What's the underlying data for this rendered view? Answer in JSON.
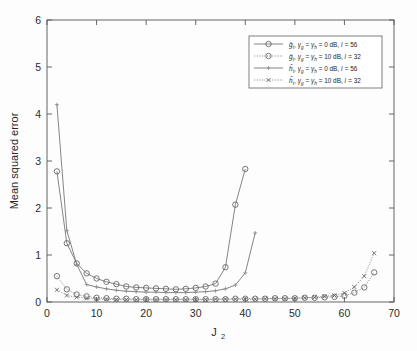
{
  "chart_data": {
    "type": "line",
    "title": "",
    "xlabel": "J_2",
    "xlabel_base": "J",
    "xlabel_sub": "2",
    "ylabel": "Mean squared error",
    "xlim": [
      0,
      70
    ],
    "ylim": [
      0,
      6
    ],
    "xticks": [
      0,
      10,
      20,
      30,
      40,
      50,
      60,
      70
    ],
    "yticks": [
      0,
      1,
      2,
      3,
      4,
      5,
      6
    ],
    "grid": false,
    "legend_position": "upper right",
    "series": [
      {
        "name": "g_hat_t, gamma_g = gamma_h = 0 dB, l = 56",
        "legend_label_parts": {
          "symbol": "g",
          "symbol_sub": "t",
          "gamma1_sub": "g",
          "gamma2_sub": "h",
          "snr": "0 dB",
          "l_value": "56"
        },
        "marker": "circle",
        "linestyle": "solid",
        "x": [
          2,
          4,
          6,
          8,
          10,
          12,
          14,
          16,
          18,
          20,
          22,
          24,
          26,
          28,
          30,
          32,
          34,
          36,
          38,
          40
        ],
        "y": [
          2.78,
          1.25,
          0.82,
          0.61,
          0.5,
          0.43,
          0.38,
          0.33,
          0.31,
          0.3,
          0.29,
          0.28,
          0.27,
          0.28,
          0.3,
          0.33,
          0.39,
          0.74,
          2.07,
          2.83
        ]
      },
      {
        "name": "g_hat_t, gamma_g = gamma_h = 10 dB, l = 32",
        "legend_label_parts": {
          "symbol": "g",
          "symbol_sub": "t",
          "gamma1_sub": "g",
          "gamma2_sub": "h",
          "snr": "10 dB",
          "l_value": "32"
        },
        "marker": "circle",
        "linestyle": "dotted",
        "x": [
          2,
          4,
          6,
          8,
          10,
          12,
          14,
          16,
          18,
          20,
          22,
          24,
          26,
          28,
          30,
          32,
          34,
          36,
          38,
          40,
          42,
          44,
          46,
          48,
          50,
          52,
          54,
          56,
          58,
          60,
          62,
          64,
          66
        ],
        "y": [
          0.55,
          0.27,
          0.16,
          0.12,
          0.09,
          0.08,
          0.07,
          0.07,
          0.06,
          0.06,
          0.06,
          0.06,
          0.06,
          0.06,
          0.06,
          0.06,
          0.06,
          0.06,
          0.07,
          0.07,
          0.07,
          0.07,
          0.08,
          0.08,
          0.08,
          0.09,
          0.09,
          0.1,
          0.11,
          0.13,
          0.2,
          0.31,
          0.63
        ]
      },
      {
        "name": "h_hat_t, gamma_g = gamma_h = 0 dB, l = 56",
        "legend_label_parts": {
          "symbol": "h",
          "symbol_sub": "t",
          "gamma1_sub": "g",
          "gamma2_sub": "h",
          "snr": "0 dB",
          "l_value": "56"
        },
        "marker": "plus",
        "linestyle": "solid",
        "x": [
          2,
          4,
          6,
          8,
          10,
          12,
          14,
          16,
          18,
          20,
          22,
          24,
          26,
          28,
          30,
          32,
          34,
          36,
          38,
          40,
          42
        ],
        "y": [
          4.2,
          1.52,
          0.8,
          0.37,
          0.32,
          0.28,
          0.25,
          0.23,
          0.22,
          0.21,
          0.21,
          0.2,
          0.2,
          0.2,
          0.21,
          0.22,
          0.24,
          0.28,
          0.36,
          0.62,
          1.47
        ]
      },
      {
        "name": "h_hat_t, gamma_g = gamma_h = 10 dB, l = 32",
        "legend_label_parts": {
          "symbol": "h",
          "symbol_sub": "t",
          "gamma1_sub": "g",
          "gamma2_sub": "h",
          "snr": "10 dB",
          "l_value": "32"
        },
        "marker": "x",
        "linestyle": "dotted",
        "x": [
          2,
          4,
          6,
          8,
          10,
          12,
          14,
          16,
          18,
          20,
          22,
          24,
          26,
          28,
          30,
          32,
          34,
          36,
          38,
          40,
          42,
          44,
          46,
          48,
          50,
          52,
          54,
          56,
          58,
          60,
          62,
          64,
          66
        ],
        "y": [
          0.26,
          0.14,
          0.1,
          0.08,
          0.06,
          0.06,
          0.05,
          0.05,
          0.05,
          0.05,
          0.05,
          0.05,
          0.05,
          0.05,
          0.05,
          0.05,
          0.06,
          0.06,
          0.06,
          0.06,
          0.06,
          0.07,
          0.07,
          0.07,
          0.08,
          0.09,
          0.1,
          0.12,
          0.14,
          0.19,
          0.32,
          0.55,
          1.04
        ]
      }
    ]
  },
  "axis": {
    "y_title": "Mean squared error",
    "x_title_base": "J",
    "x_title_sub": "2",
    "xticks": [
      "0",
      "10",
      "20",
      "30",
      "40",
      "50",
      "60",
      "70"
    ],
    "yticks": [
      "0",
      "1",
      "2",
      "3",
      "4",
      "5",
      "6"
    ]
  },
  "legend": {
    "entries": [
      {
        "symbol": "g",
        "symbol_sub": "t",
        "gamma1_sub": "g",
        "gamma2_sub": "h",
        "eq1": ", ",
        "snr": "= 0 dB, ",
        "l_text": "= 56",
        "marker": "circle",
        "linestyle": "solid"
      },
      {
        "symbol": "g",
        "symbol_sub": "t",
        "gamma1_sub": "g",
        "gamma2_sub": "h",
        "eq1": ", ",
        "snr": "= 10 dB, ",
        "l_text": "= 32",
        "marker": "circle",
        "linestyle": "dotted"
      },
      {
        "symbol": "h",
        "symbol_sub": "t",
        "gamma1_sub": "g",
        "gamma2_sub": "h",
        "eq1": ", ",
        "snr": "= 0 dB, ",
        "l_text": "= 56",
        "marker": "plus",
        "linestyle": "solid"
      },
      {
        "symbol": "h",
        "symbol_sub": "t",
        "gamma1_sub": "g",
        "gamma2_sub": "h",
        "eq1": ", ",
        "snr": "= 10 dB, ",
        "l_text": "= 32",
        "marker": "x",
        "linestyle": "dotted"
      }
    ]
  },
  "colors": {
    "axis": "#555555",
    "series": "#6f6f6f",
    "background": "#fdfdfd",
    "legend_border": "#606060"
  }
}
